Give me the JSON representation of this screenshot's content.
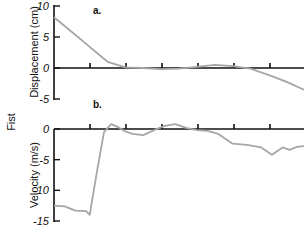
{
  "figure": {
    "side_label": "Fist",
    "colors": {
      "axis": "#111111",
      "trace": "#a6a6a6"
    }
  },
  "chart_data": [
    {
      "type": "line",
      "panel_label": "a.",
      "title": "",
      "xlabel": "",
      "ylabel": "Displacement (cm)",
      "ylim": [
        -5,
        10
      ],
      "yticks": [
        "10",
        "5",
        "0",
        "-5"
      ],
      "grid": false,
      "x_ticks_count": 6,
      "x": [
        0,
        0.5,
        1,
        1.5,
        2,
        2.5,
        3,
        3.5,
        4,
        4.5,
        5,
        5.5,
        6,
        6.5,
        7
      ],
      "series": [
        {
          "name": "Displacement",
          "values": [
            8.2,
            5.8,
            3.4,
            1.0,
            0.1,
            0.0,
            -0.2,
            -0.1,
            0.2,
            0.5,
            0.3,
            -0.1,
            -1.1,
            -2.2,
            -3.5
          ]
        }
      ]
    },
    {
      "type": "line",
      "panel_label": "b.",
      "title": "",
      "xlabel": "",
      "ylabel": "Velocity (m/s)",
      "ylim": [
        -15,
        0
      ],
      "yticks": [
        "0",
        "-5",
        "-10",
        "-15"
      ],
      "grid": false,
      "x_ticks_count": 6,
      "x": [
        0,
        0.3,
        0.6,
        0.9,
        1.0,
        1.2,
        1.4,
        1.6,
        1.8,
        2.0,
        2.2,
        2.5,
        2.8,
        3.1,
        3.4,
        3.7,
        4.0,
        4.3,
        4.6,
        5.0,
        5.4,
        5.8,
        6.1,
        6.4,
        6.6,
        6.8,
        7.0
      ],
      "series": [
        {
          "name": "Velocity",
          "values": [
            -12.5,
            -12.6,
            -13.3,
            -13.4,
            -14.0,
            -7.0,
            -0.5,
            0.8,
            0.3,
            -0.4,
            -0.8,
            -1.0,
            -0.2,
            0.5,
            0.8,
            0.2,
            -0.2,
            -0.3,
            -0.8,
            -2.4,
            -2.6,
            -3.0,
            -4.2,
            -3.0,
            -3.4,
            -2.9,
            -2.8
          ]
        }
      ]
    }
  ]
}
